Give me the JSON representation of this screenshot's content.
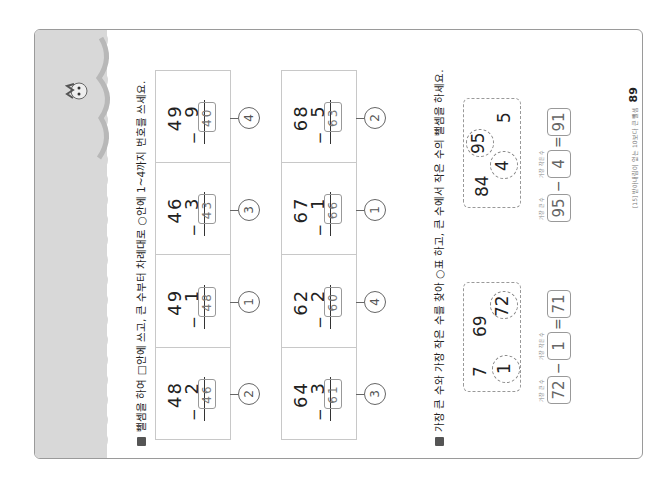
{
  "section1": {
    "instruction": "뺄셈을 하여 □안에 쓰고, 큰 수부터 차례대로 ○안에 1~4까지 번호를 쓰세요.",
    "rows": [
      {
        "cells": [
          {
            "top": "48",
            "bottom": "2",
            "answer": "46",
            "rank": "2"
          },
          {
            "top": "49",
            "bottom": "1",
            "answer": "48",
            "rank": "1"
          },
          {
            "top": "46",
            "bottom": "3",
            "answer": "43",
            "rank": "3"
          },
          {
            "top": "49",
            "bottom": "9",
            "answer": "40",
            "rank": "4"
          }
        ]
      },
      {
        "cells": [
          {
            "top": "64",
            "bottom": "3",
            "answer": "61",
            "rank": "3"
          },
          {
            "top": "62",
            "bottom": "2",
            "answer": "60",
            "rank": "4"
          },
          {
            "top": "67",
            "bottom": "1",
            "answer": "66",
            "rank": "1"
          },
          {
            "top": "68",
            "bottom": "5",
            "answer": "63",
            "rank": "2"
          }
        ]
      }
    ],
    "minus": "−"
  },
  "section2": {
    "instruction": "가장 큰 수와 가장 작은 수를 찾아 ○표 하고, 큰 수에서 작은 수의 뺄셈을 하세요.",
    "label_largest": "가장 큰 수",
    "label_smallest": "가장 작은 수",
    "problems": [
      {
        "numbers": [
          "7",
          "69",
          "1",
          "72"
        ],
        "largest": "72",
        "smallest": "1",
        "result": "71"
      },
      {
        "numbers": [
          "84",
          "95",
          "4",
          "5"
        ],
        "largest": "95",
        "smallest": "4",
        "result": "91"
      }
    ],
    "minus": "−",
    "equals": "="
  },
  "footer": {
    "text": "[15] 받아내림이 없는 10보다 큰 뺄셈",
    "page_number": "89"
  }
}
